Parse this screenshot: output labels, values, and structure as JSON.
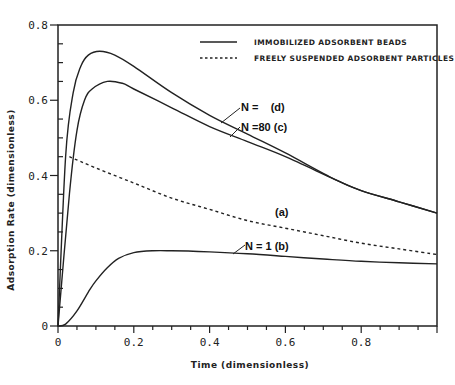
{
  "chart_data": {
    "type": "line",
    "title": "",
    "xlabel": "Time (dimensionless)",
    "ylabel": "Adsorption Rate (dimensionless)",
    "xlim": [
      0,
      1.0
    ],
    "ylim": [
      0,
      0.8
    ],
    "x_ticks": [
      "0",
      "0.2",
      "0.4",
      "0.6",
      "0.8"
    ],
    "y_ticks": [
      "0",
      "0.2",
      "0.4",
      "0.6",
      "0.8"
    ],
    "grid": false,
    "legend": {
      "position": "upper right",
      "entries": [
        {
          "label": "Immobilized adsorbent beads",
          "style": "solid"
        },
        {
          "label": "Freely suspended adsorbent particles",
          "style": "dashed"
        }
      ]
    },
    "series": [
      {
        "name": "N = ∞ (d)",
        "style": "solid",
        "label": "N =   (d)",
        "x": [
          0.0,
          0.02,
          0.04,
          0.06,
          0.08,
          0.11,
          0.15,
          0.2,
          0.3,
          0.4,
          0.5,
          0.6,
          0.73,
          0.8,
          0.9,
          1.0
        ],
        "y": [
          0.0,
          0.45,
          0.62,
          0.69,
          0.72,
          0.73,
          0.72,
          0.69,
          0.62,
          0.56,
          0.51,
          0.46,
          0.39,
          0.36,
          0.33,
          0.3
        ]
      },
      {
        "name": "N = 80 (c)",
        "style": "solid",
        "label": "N =80 (c)",
        "x": [
          0.0,
          0.03,
          0.05,
          0.07,
          0.09,
          0.13,
          0.17,
          0.2,
          0.3,
          0.4,
          0.5,
          0.6,
          0.73,
          0.8,
          0.9,
          1.0
        ],
        "y": [
          0.0,
          0.35,
          0.52,
          0.6,
          0.63,
          0.65,
          0.645,
          0.63,
          0.58,
          0.53,
          0.49,
          0.45,
          0.39,
          0.36,
          0.33,
          0.3
        ]
      },
      {
        "name": "(a) Freely suspended",
        "style": "dashed",
        "label": "(a)",
        "x": [
          0.03,
          0.1,
          0.2,
          0.3,
          0.4,
          0.5,
          0.6,
          0.7,
          0.8,
          0.9,
          1.0
        ],
        "y": [
          0.45,
          0.42,
          0.38,
          0.34,
          0.31,
          0.28,
          0.26,
          0.24,
          0.22,
          0.205,
          0.19
        ]
      },
      {
        "name": "N = 1 (b)",
        "style": "solid",
        "label": "N = 1 (b)",
        "x": [
          0.0,
          0.02,
          0.05,
          0.08,
          0.1,
          0.13,
          0.16,
          0.2,
          0.25,
          0.3,
          0.4,
          0.5,
          0.6,
          0.7,
          0.8,
          0.9,
          1.0
        ],
        "y": [
          0.0,
          0.005,
          0.04,
          0.09,
          0.12,
          0.155,
          0.18,
          0.195,
          0.2,
          0.2,
          0.197,
          0.192,
          0.185,
          0.178,
          0.172,
          0.168,
          0.165
        ]
      }
    ],
    "annotations": [
      {
        "text": "N =   (d)",
        "x": 0.55,
        "y": 0.62
      },
      {
        "text": "N =80 (c)",
        "x": 0.56,
        "y": 0.57
      },
      {
        "text": "(a)",
        "x": 0.66,
        "y": 0.29
      },
      {
        "text": "N = 1 (b)",
        "x": 0.6,
        "y": 0.23
      }
    ]
  },
  "labels": {
    "y_axis_title": "Adsorption Rate (dimensionless)",
    "x_axis_title": "Time (dimensionless)",
    "legend_solid": "IMMOBILIZED ADSORBENT BEADS",
    "legend_dashed": "FREELY SUSPENDED ADSORBENT PARTICLES",
    "annot_d": "N =    (d)",
    "annot_c": "N =80 (c)",
    "annot_a": "(a)",
    "annot_b": "N = 1 (b)"
  }
}
